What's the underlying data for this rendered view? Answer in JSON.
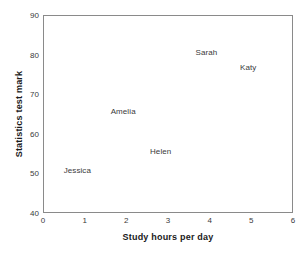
{
  "chart_data": {
    "type": "scatter",
    "title": "",
    "xlabel": "Study hours per day",
    "ylabel": "Statistics test mark",
    "xlim": [
      0,
      6
    ],
    "ylim": [
      40,
      90
    ],
    "xticks": [
      "0",
      "1",
      "2",
      "3",
      "4",
      "5",
      "6"
    ],
    "yticks": [
      "40",
      "50",
      "60",
      "70",
      "80",
      "90"
    ],
    "grid": false,
    "legend": "none",
    "marker_style": "text-label-only",
    "points": [
      {
        "label": "Jessica",
        "x": 0.8,
        "y": 51
      },
      {
        "label": "Amelia",
        "x": 1.9,
        "y": 66
      },
      {
        "label": "Helen",
        "x": 2.8,
        "y": 56
      },
      {
        "label": "Sarah",
        "x": 3.9,
        "y": 81
      },
      {
        "label": "Katy",
        "x": 4.9,
        "y": 77
      }
    ],
    "colors": {
      "frame": "#8a8a8a",
      "text": "#3a3a3a",
      "axis_title": "#1a1a1a",
      "background": "#ffffff"
    }
  }
}
